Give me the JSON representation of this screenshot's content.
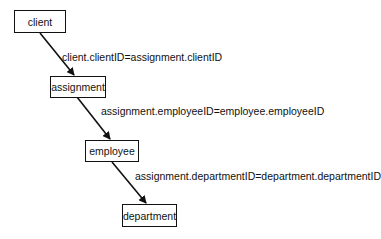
{
  "diagram": {
    "nodes": [
      {
        "id": "client",
        "label": "client"
      },
      {
        "id": "assignment",
        "label": "assignment"
      },
      {
        "id": "employee",
        "label": "employee"
      },
      {
        "id": "department",
        "label": "department"
      }
    ],
    "edges": [
      {
        "from": "client",
        "to": "assignment",
        "label": "client.clientID=assignment.clientID"
      },
      {
        "from": "assignment",
        "to": "employee",
        "label": "assignment.employeeID=employee.employeeID"
      },
      {
        "from": "employee",
        "to": "department",
        "label": "assignment.departmentID=department.departmentID"
      }
    ]
  }
}
